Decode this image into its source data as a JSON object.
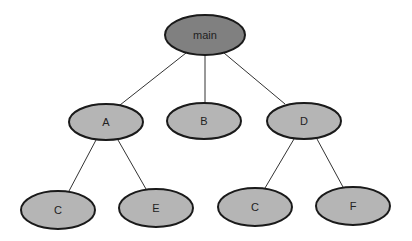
{
  "diagram": {
    "type": "tree",
    "colors": {
      "root_fill": "#808080",
      "node_fill": "#b5b5b5",
      "stroke": "#1a1a1a",
      "edge": "#333333"
    },
    "nodes": [
      {
        "id": "main",
        "label": "main",
        "cx": 205,
        "cy": 35,
        "rx": 40,
        "ry": 20,
        "root": true
      },
      {
        "id": "A",
        "label": "A",
        "cx": 106,
        "cy": 122,
        "rx": 37,
        "ry": 18
      },
      {
        "id": "B",
        "label": "B",
        "cx": 204,
        "cy": 121,
        "rx": 37,
        "ry": 18
      },
      {
        "id": "D",
        "label": "D",
        "cx": 304,
        "cy": 121,
        "rx": 37,
        "ry": 18
      },
      {
        "id": "C1",
        "label": "C",
        "cx": 58,
        "cy": 210,
        "rx": 37,
        "ry": 19
      },
      {
        "id": "E",
        "label": "E",
        "cx": 156,
        "cy": 208,
        "rx": 37,
        "ry": 19
      },
      {
        "id": "C2",
        "label": "C",
        "cx": 255,
        "cy": 207,
        "rx": 37,
        "ry": 19
      },
      {
        "id": "F",
        "label": "F",
        "cx": 353,
        "cy": 206,
        "rx": 37,
        "ry": 19
      }
    ],
    "edges": [
      {
        "from": "main",
        "to": "A",
        "x1": 186,
        "y1": 53,
        "x2": 120,
        "y2": 105
      },
      {
        "from": "main",
        "to": "B",
        "x1": 205,
        "y1": 55,
        "x2": 205,
        "y2": 103
      },
      {
        "from": "main",
        "to": "D",
        "x1": 224,
        "y1": 53,
        "x2": 285,
        "y2": 104
      },
      {
        "from": "A",
        "to": "C1",
        "x1": 96,
        "y1": 140,
        "x2": 69,
        "y2": 191
      },
      {
        "from": "A",
        "to": "E",
        "x1": 118,
        "y1": 140,
        "x2": 146,
        "y2": 189
      },
      {
        "from": "D",
        "to": "C2",
        "x1": 294,
        "y1": 139,
        "x2": 265,
        "y2": 188
      },
      {
        "from": "D",
        "to": "F",
        "x1": 317,
        "y1": 139,
        "x2": 343,
        "y2": 187
      }
    ]
  }
}
